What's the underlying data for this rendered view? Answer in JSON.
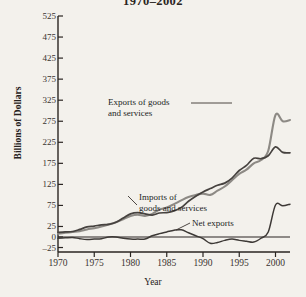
{
  "chart_data": {
    "type": "line",
    "title": "1970–2002",
    "xlabel": "Year",
    "ylabel": "Billions of Dollars",
    "xlim": [
      1970,
      2002
    ],
    "ylim": [
      -25,
      525
    ],
    "grid": false,
    "legend_position": "inline-annotations",
    "ytick_labels": [
      "525",
      "475",
      "425",
      "375",
      "325",
      "275",
      "225",
      "175",
      "125",
      "75",
      "25",
      "0",
      "–25"
    ],
    "ytick_values": [
      525,
      475,
      425,
      375,
      325,
      275,
      225,
      175,
      125,
      75,
      25,
      0,
      -25
    ],
    "xtick_labels": [
      "1970",
      "1975",
      "1980",
      "1985",
      "1990",
      "1995",
      "2000"
    ],
    "xtick_values": [
      1970,
      1975,
      1980,
      1985,
      1990,
      1995,
      2000
    ],
    "x": [
      1970,
      1971,
      1972,
      1973,
      1974,
      1975,
      1976,
      1977,
      1978,
      1979,
      1980,
      1981,
      1982,
      1983,
      1984,
      1985,
      1986,
      1987,
      1988,
      1989,
      1990,
      1991,
      1992,
      1993,
      1994,
      1995,
      1996,
      1997,
      1998,
      1999,
      2000,
      2001,
      2002
    ],
    "series": [
      {
        "name": "Imports of goods and services",
        "color": "#8d8a85",
        "annotation": "Imports of\ngoods and services",
        "values": [
          40,
          46,
          56,
          69,
          91,
          99,
          124,
          152,
          176,
          212,
          245,
          261,
          244,
          258,
          330,
          336,
          368,
          410,
          448,
          477,
          498,
          491,
          537,
          589,
          669,
          749,
          803,
          876,
          918,
          1024,
          1445,
          1370,
          1395
        ]
      },
      {
        "name": "Exports of goods and services",
        "color": "#46423f",
        "annotation": "Exports of goods\nand services",
        "values": [
          57,
          59,
          67,
          92,
          121,
          133,
          143,
          152,
          178,
          224,
          272,
          294,
          276,
          262,
          286,
          289,
          310,
          349,
          425,
          487,
          536,
          578,
          616,
          643,
          703,
          795,
          852,
          934,
          933,
          966,
          1071,
          1005,
          1001
        ]
      },
      {
        "name": "Net exports",
        "color": "#3d3936",
        "annotation": "Net exports",
        "values": [
          4,
          1,
          -3,
          7,
          5,
          18,
          9,
          -9,
          -10,
          -6,
          -14,
          -15,
          -20,
          -51,
          -102,
          -115,
          -132,
          -145,
          -110,
          -88,
          -78,
          -27,
          -33,
          -65,
          -93,
          -91,
          -96,
          -101,
          -160,
          -262,
          -379,
          -367,
          -424
        ]
      }
    ],
    "plot_series_pixels": {
      "note": "series drawn in Billions of Dollars on the 0..525 axis as rendered",
      "imports_y": [
        8,
        10,
        12,
        14,
        18,
        21,
        25,
        30,
        35,
        42,
        50,
        53,
        50,
        55,
        65,
        70,
        78,
        87,
        95,
        100,
        103,
        100,
        110,
        120,
        135,
        150,
        160,
        175,
        183,
        205,
        290,
        275,
        278
      ],
      "exports_y": [
        11,
        12,
        13,
        18,
        24,
        26,
        29,
        30,
        35,
        45,
        55,
        58,
        55,
        52,
        57,
        58,
        62,
        70,
        85,
        97,
        107,
        115,
        123,
        128,
        140,
        158,
        170,
        187,
        186,
        193,
        214,
        201,
        200
      ]
    }
  },
  "annotations": {
    "exports": "Exports of goods\nand services",
    "imports": "Imports of\ngoods and services",
    "net": "Net exports"
  },
  "colors": {
    "background": "#f3f1ec",
    "axis": "#2a2522",
    "imports_line": "#8d8a85",
    "exports_line": "#46423f",
    "net_line": "#3d3936"
  }
}
